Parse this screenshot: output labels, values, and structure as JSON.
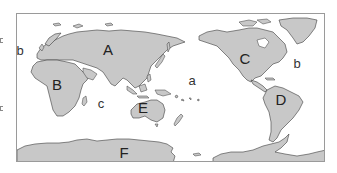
{
  "figure": {
    "type": "world-map",
    "projection": "equirectangular, Pacific-centered",
    "colors": {
      "land": "#c8c8c8",
      "coastline": "#3a3a3a",
      "ocean": "#ffffff",
      "frame": "#9a9a9a",
      "label": "#222222"
    },
    "continent_labels": [
      {
        "id": "A",
        "text": "A",
        "region": "Eurasia"
      },
      {
        "id": "B",
        "text": "B",
        "region": "Africa"
      },
      {
        "id": "C",
        "text": "C",
        "region": "North America"
      },
      {
        "id": "D",
        "text": "D",
        "region": "South America"
      },
      {
        "id": "E",
        "text": "E",
        "region": "Australia"
      },
      {
        "id": "F",
        "text": "F",
        "region": "Antarctica"
      }
    ],
    "ocean_labels": [
      {
        "id": "a",
        "text": "a",
        "region": "Pacific Ocean"
      },
      {
        "id": "b_west",
        "text": "b",
        "region": "Atlantic Ocean (west edge)"
      },
      {
        "id": "b_east",
        "text": "b",
        "region": "Atlantic Ocean (east edge)"
      },
      {
        "id": "c",
        "text": "c",
        "region": "Indian Ocean"
      }
    ]
  }
}
